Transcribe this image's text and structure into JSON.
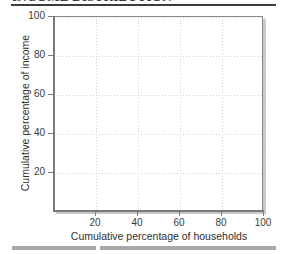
{
  "page": {
    "title_partial": "INCOME DISTRIBUTION"
  },
  "chart_data": {
    "type": "line",
    "title": "",
    "xlabel": "Cumulative percentage of households",
    "ylabel": "Cumulative percentage of income",
    "xlim": [
      0,
      100
    ],
    "ylim": [
      0,
      100
    ],
    "xticks": [
      20,
      40,
      60,
      80,
      100
    ],
    "yticks": [
      20,
      40,
      60,
      80,
      100
    ],
    "xticklabels": [
      "20",
      "40",
      "60",
      "80",
      "100"
    ],
    "yticklabels": [
      "20",
      "40",
      "60",
      "80",
      "100"
    ],
    "grid": true,
    "grid_style": "dotted",
    "legend": null,
    "series": [],
    "annotations": [],
    "note": "empty plotting grid; no data series drawn"
  },
  "style": {
    "grid_color": "#d0d0d0",
    "axis_color": "#7a7a7a",
    "frame_color": "#8a8a8a",
    "text_color": "#2f2f2f",
    "rule_top_color": "#3c3c3c",
    "rule_bottom_color": "#a9a9a9",
    "background": "#ffffff"
  }
}
